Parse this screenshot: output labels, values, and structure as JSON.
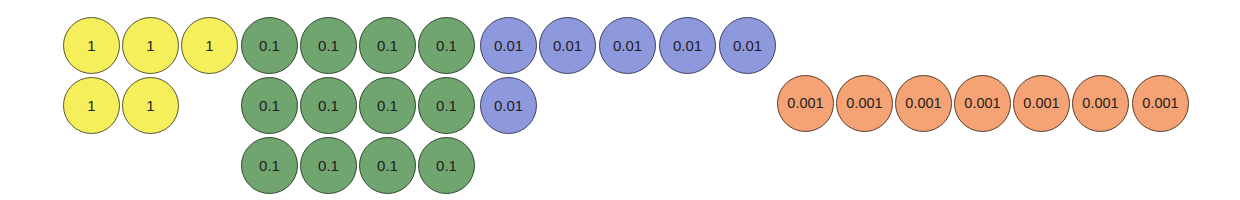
{
  "diagram": {
    "colors": {
      "ones": "#f5ef5b",
      "tenths": "#70a56f",
      "hundredths": "#8e98dd",
      "thousandths": "#f5a374"
    },
    "groups": [
      {
        "name": "ones",
        "label": "1",
        "count": 5,
        "color": "#f5ef5b",
        "discs": [
          {
            "label": "1",
            "x": 63,
            "y": 17
          },
          {
            "label": "1",
            "x": 122,
            "y": 17
          },
          {
            "label": "1",
            "x": 181,
            "y": 17
          },
          {
            "label": "1",
            "x": 63,
            "y": 77
          },
          {
            "label": "1",
            "x": 122,
            "y": 77
          }
        ]
      },
      {
        "name": "tenths",
        "label": "0.1",
        "count": 12,
        "color": "#70a56f",
        "discs": [
          {
            "label": "0.1",
            "x": 241,
            "y": 17
          },
          {
            "label": "0.1",
            "x": 300,
            "y": 17
          },
          {
            "label": "0.1",
            "x": 359,
            "y": 17
          },
          {
            "label": "0.1",
            "x": 418,
            "y": 17
          },
          {
            "label": "0.1",
            "x": 241,
            "y": 77
          },
          {
            "label": "0.1",
            "x": 300,
            "y": 77
          },
          {
            "label": "0.1",
            "x": 359,
            "y": 77
          },
          {
            "label": "0.1",
            "x": 418,
            "y": 77
          },
          {
            "label": "0.1",
            "x": 241,
            "y": 137
          },
          {
            "label": "0.1",
            "x": 300,
            "y": 137
          },
          {
            "label": "0.1",
            "x": 359,
            "y": 137
          },
          {
            "label": "0.1",
            "x": 418,
            "y": 137
          }
        ]
      },
      {
        "name": "hundredths",
        "label": "0.01",
        "count": 6,
        "color": "#8e98dd",
        "discs": [
          {
            "label": "0.01",
            "x": 480,
            "y": 17
          },
          {
            "label": "0.01",
            "x": 539,
            "y": 17
          },
          {
            "label": "0.01",
            "x": 599,
            "y": 17
          },
          {
            "label": "0.01",
            "x": 659,
            "y": 17
          },
          {
            "label": "0.01",
            "x": 719,
            "y": 17
          },
          {
            "label": "0.01",
            "x": 480,
            "y": 77
          }
        ]
      },
      {
        "name": "thousandths",
        "label": "0.001",
        "count": 7,
        "color": "#f5a374",
        "discs": [
          {
            "label": "0.001",
            "x": 777,
            "y": 75
          },
          {
            "label": "0.001",
            "x": 836,
            "y": 75
          },
          {
            "label": "0.001",
            "x": 895,
            "y": 75
          },
          {
            "label": "0.001",
            "x": 954,
            "y": 75
          },
          {
            "label": "0.001",
            "x": 1013,
            "y": 75
          },
          {
            "label": "0.001",
            "x": 1072,
            "y": 75
          },
          {
            "label": "0.001",
            "x": 1132,
            "y": 75
          }
        ]
      }
    ]
  }
}
